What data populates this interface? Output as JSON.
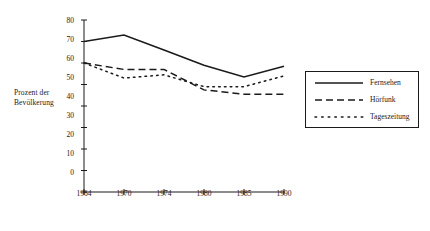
{
  "chart_data": {
    "type": "line",
    "title": "",
    "subtitle": "",
    "xlabel": "",
    "ylabel": "Prozent der Bevölkerung",
    "ylabel_lines": [
      "Prozent der",
      "Bevölkerung"
    ],
    "categories": [
      "1964",
      "1970",
      "1974",
      "1980",
      "1985",
      "1990"
    ],
    "x": [
      1964,
      1970,
      1974,
      1980,
      1985,
      1990
    ],
    "xlim": [
      0,
      5
    ],
    "ylim": [
      0,
      80
    ],
    "yticks": [
      0,
      10,
      20,
      30,
      40,
      50,
      60,
      70,
      80
    ],
    "ytick_labels": [
      "0",
      "10",
      "20",
      "30",
      "40",
      "50",
      "60",
      "70",
      "80"
    ],
    "xtick_labels": [
      "1964",
      "1970",
      "1974",
      "1980",
      "1985",
      "1990"
    ],
    "grid": false,
    "legend_position": "right",
    "series": [
      {
        "name": "Fernsehen",
        "style": "solid",
        "color": "#1a1a1a",
        "values": [
          70,
          73,
          66,
          59,
          53.5,
          58.5
        ]
      },
      {
        "name": "Hörfunk",
        "style": "dashed",
        "color": "#1a1a1a",
        "values": [
          60,
          57,
          57,
          47.5,
          45.5,
          45.5
        ]
      },
      {
        "name": "Tageszeitung",
        "style": "dotted",
        "color": "#1a1a1a",
        "values": [
          60,
          53,
          54.5,
          49,
          49,
          54
        ]
      }
    ]
  },
  "legend": {
    "entries": [
      {
        "label": "Fernsehen",
        "style": "solid"
      },
      {
        "label": "Hörfunk",
        "style": "dashed"
      },
      {
        "label": "Tageszeitung",
        "style": "dotted"
      }
    ]
  },
  "axes": {
    "y_label_line1": "Prozent der",
    "y_label_line2": "Bevölkerung",
    "y_ticks": [
      "80",
      "70",
      "60",
      "50",
      "40",
      "30",
      "20",
      "10",
      "0"
    ],
    "x_ticks": [
      "1964",
      "1970",
      "1974",
      "1980",
      "1985",
      "1990"
    ]
  },
  "colors": {
    "ink": "#1a1a1a",
    "background": "#ffffff"
  }
}
